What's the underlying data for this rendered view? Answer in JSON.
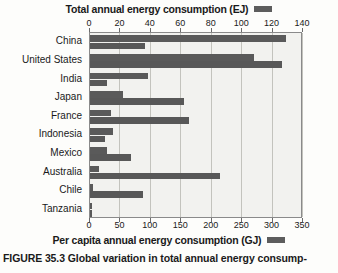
{
  "figure": {
    "caption_number": "FIGURE 35.3",
    "caption_text": "Global variation in total annual energy consump-"
  },
  "legend": {
    "top_label": "Total annual energy consumption (EJ)",
    "bottom_label": "Per capita annual energy consumption (GJ)",
    "swatch_color": "#5d5d5d"
  },
  "chart_data": {
    "type": "bar",
    "orientation": "horizontal",
    "title": "Total annual energy consumption (EJ)",
    "xlabel": "Total annual energy consumption (EJ)",
    "xlabel_secondary": "Per capita annual energy consumption (GJ)",
    "ylabel": "",
    "grid": true,
    "legend_position": "top-and-bottom",
    "categories": [
      "China",
      "United States",
      "India",
      "Japan",
      "France",
      "Indonesia",
      "Mexico",
      "Australia",
      "Chile",
      "Tanzania"
    ],
    "top_axis": {
      "label": "Total annual energy consumption (EJ)",
      "ticks": [
        0,
        20,
        40,
        60,
        80,
        100,
        120,
        140
      ],
      "xlim": [
        0,
        140
      ],
      "units": "EJ"
    },
    "bottom_axis": {
      "label": "Per capita annual energy consumption (GJ)",
      "ticks": [
        0,
        50,
        100,
        150,
        200,
        250,
        300,
        350
      ],
      "xlim": [
        0,
        350
      ],
      "units": "GJ"
    },
    "series": [
      {
        "name": "Total annual energy consumption (EJ)",
        "axis": "top",
        "units": "EJ",
        "color": "#5a5a5a",
        "values": [
          129,
          108,
          38,
          22,
          14,
          15,
          11,
          6,
          2,
          1
        ]
      },
      {
        "name": "Per capita annual energy consumption (GJ)",
        "axis": "bottom",
        "units": "GJ",
        "color": "#585858",
        "values": [
          91,
          315,
          28,
          154,
          163,
          25,
          67,
          214,
          87,
          4
        ]
      }
    ]
  }
}
